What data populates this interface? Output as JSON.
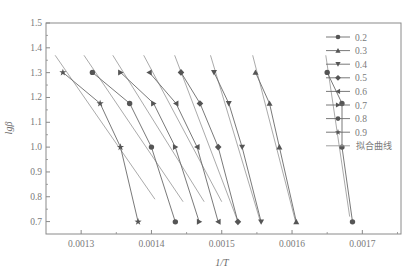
{
  "chart_data": {
    "type": "line",
    "title": "",
    "xlabel": "1/T",
    "ylabel": "lgβ",
    "xlim": [
      0.00125,
      0.001755
    ],
    "ylim": [
      0.65,
      1.5
    ],
    "xticks": [
      0.0013,
      0.0014,
      0.0015,
      0.0016,
      0.0017
    ],
    "xtick_labels": [
      "0.0013",
      "0.0014",
      "0.0015",
      "0.0016",
      "0.0017"
    ],
    "yticks": [
      0.7,
      0.8,
      0.9,
      1.0,
      1.1,
      1.2,
      1.3,
      1.4,
      1.5
    ],
    "ytick_labels": [
      "0.7",
      "0.8",
      "0.9",
      "1.0",
      "1.1",
      "1.2",
      "1.3",
      "1.4",
      "1.5"
    ],
    "grid": false,
    "legend_position": "upper right",
    "y_values": [
      1.301,
      1.176,
      1.0,
      0.699
    ],
    "series": [
      {
        "name": "0.2",
        "marker": "circle",
        "x": [
          0.00165,
          0.001671,
          0.001671,
          0.001686
        ],
        "y": [
          1.301,
          1.176,
          1.0,
          0.699
        ]
      },
      {
        "name": "0.3",
        "marker": "triangle-up",
        "x": [
          0.001548,
          0.001568,
          0.001582,
          0.001606
        ],
        "y": [
          1.301,
          1.176,
          1.0,
          0.699
        ]
      },
      {
        "name": "0.4",
        "marker": "triangle-down",
        "x": [
          0.001489,
          0.00151,
          0.001529,
          0.001556
        ],
        "y": [
          1.301,
          1.176,
          1.0,
          0.699
        ]
      },
      {
        "name": "0.5",
        "marker": "diamond",
        "x": [
          0.001442,
          0.001469,
          0.001495,
          0.001523
        ],
        "y": [
          1.301,
          1.176,
          1.0,
          0.699
        ]
      },
      {
        "name": "0.6",
        "marker": "triangle-left",
        "x": [
          0.001397,
          0.001435,
          0.001465,
          0.001495
        ],
        "y": [
          1.301,
          1.176,
          1.0,
          0.699
        ]
      },
      {
        "name": "0.7",
        "marker": "triangle-right",
        "x": [
          0.001356,
          0.001403,
          0.001434,
          0.001468
        ],
        "y": [
          1.301,
          1.176,
          1.0,
          0.699
        ]
      },
      {
        "name": "0.8",
        "marker": "circle",
        "x": [
          0.001316,
          0.001369,
          0.0014,
          0.001434
        ],
        "y": [
          1.301,
          1.176,
          1.0,
          0.699
        ]
      },
      {
        "name": "0.9",
        "marker": "star",
        "x": [
          0.001274,
          0.001327,
          0.001356,
          0.001381
        ],
        "y": [
          1.301,
          1.176,
          1.0,
          0.699
        ]
      }
    ],
    "fit_lines": [
      {
        "series": "0.2",
        "x": [
          0.001648,
          0.001682
        ],
        "y": [
          1.37,
          0.72
        ]
      },
      {
        "series": "0.3",
        "x": [
          0.001544,
          0.001605
        ],
        "y": [
          1.37,
          0.7
        ]
      },
      {
        "series": "0.4",
        "x": [
          0.001484,
          0.001555
        ],
        "y": [
          1.37,
          0.7
        ]
      },
      {
        "series": "0.5",
        "x": [
          0.001433,
          0.001523
        ],
        "y": [
          1.37,
          0.7
        ]
      },
      {
        "series": "0.6",
        "x": [
          0.001389,
          0.0015
        ],
        "y": [
          1.37,
          0.78
        ]
      },
      {
        "series": "0.7",
        "x": [
          0.001345,
          0.001475
        ],
        "y": [
          1.37,
          0.78
        ]
      },
      {
        "series": "0.8",
        "x": [
          0.001304,
          0.001445
        ],
        "y": [
          1.37,
          0.78
        ]
      },
      {
        "series": "0.9",
        "x": [
          0.001263,
          0.001405
        ],
        "y": [
          1.37,
          0.79
        ]
      }
    ],
    "legend": [
      {
        "label": "0.2",
        "marker": "circle"
      },
      {
        "label": "0.3",
        "marker": "triangle-up"
      },
      {
        "label": "0.4",
        "marker": "triangle-down"
      },
      {
        "label": "0.5",
        "marker": "diamond"
      },
      {
        "label": "0.6",
        "marker": "triangle-left"
      },
      {
        "label": "0.7",
        "marker": "triangle-right"
      },
      {
        "label": "0.8",
        "marker": "circle"
      },
      {
        "label": "0.9",
        "marker": "star"
      },
      {
        "label": "拟合曲线",
        "marker": "line"
      }
    ]
  },
  "colors": {
    "axis": "#8a8a8a",
    "marker": "#555555",
    "series_line": "#6a6a6a",
    "fit_line": "#a0a0a0",
    "text": "#7a7a7a"
  }
}
